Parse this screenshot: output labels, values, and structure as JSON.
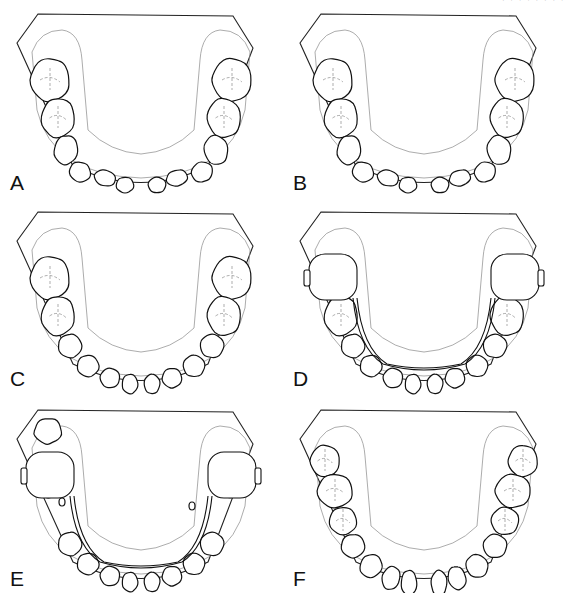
{
  "figure": {
    "top_right_fragment": "· · · · · · · ·",
    "panels": [
      {
        "id": "A",
        "label": "A",
        "appliance": false,
        "variant": "crowded-incisors"
      },
      {
        "id": "B",
        "label": "B",
        "appliance": false,
        "variant": "crowded-incisors"
      },
      {
        "id": "C",
        "label": "C",
        "appliance": false,
        "variant": "aligned"
      },
      {
        "id": "D",
        "label": "D",
        "appliance": true,
        "variant": "lingual-arch"
      },
      {
        "id": "E",
        "label": "E",
        "appliance": true,
        "variant": "lingual-arch-erupting-molar"
      },
      {
        "id": "F",
        "label": "F",
        "appliance": false,
        "variant": "permanent-dentition"
      }
    ]
  }
}
